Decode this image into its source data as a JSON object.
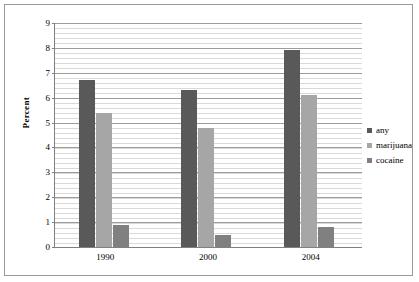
{
  "chart_data": {
    "type": "bar",
    "title": "",
    "xlabel": "",
    "ylabel": "Percent",
    "categories": [
      "1990",
      "2000",
      "2004"
    ],
    "series": [
      {
        "name": "any",
        "color": "#595959",
        "values": [
          6.7,
          6.3,
          7.9
        ]
      },
      {
        "name": "marijuana",
        "color": "#a6a6a6",
        "values": [
          5.4,
          4.8,
          6.1
        ]
      },
      {
        "name": "cocaine",
        "color": "#808080",
        "values": [
          0.9,
          0.5,
          0.8
        ]
      }
    ],
    "ylim": [
      0,
      9
    ],
    "yticks": [
      0,
      1,
      2,
      3,
      4,
      5,
      6,
      7,
      8,
      9
    ],
    "ytick_labels": [
      "0",
      "1",
      "2",
      "3",
      "4",
      "5",
      "6",
      "7",
      "8",
      "9"
    ],
    "grid": "horizontal",
    "legend_position": "right"
  },
  "axes": {
    "y_title": "Percent"
  },
  "legend": {
    "items": [
      {
        "label": "any"
      },
      {
        "label": "marijuana"
      },
      {
        "label": "cocaine"
      }
    ]
  }
}
